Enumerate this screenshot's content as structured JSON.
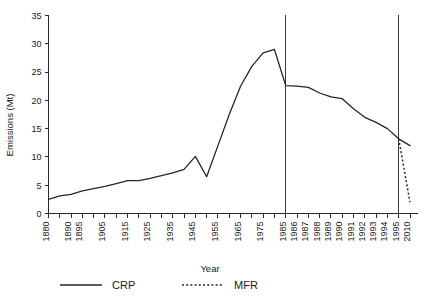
{
  "chart_data": {
    "type": "line",
    "title": "",
    "xlabel": "Year",
    "ylabel": "Emissions (Mt)",
    "ylim": [
      0,
      35
    ],
    "yticks": [
      0,
      5,
      10,
      15,
      20,
      25,
      30,
      35
    ],
    "ytick_labels": [
      "0",
      "5",
      "10",
      "15",
      "20",
      "25",
      "30",
      "35"
    ],
    "grid": false,
    "legend_position": "below-axes",
    "x_axis_note": "non-uniform category axis: 5-year steps 1880-1985, yearly 1985-1995, then 2010",
    "xticks": [
      "1880",
      "1885",
      "1890",
      "1895",
      "1900",
      "1905",
      "1910",
      "1915",
      "1920",
      "1925",
      "1930",
      "1935",
      "1940",
      "1945",
      "1950",
      "1955",
      "1960",
      "1965",
      "1970",
      "1975",
      "1980",
      "1985",
      "1986",
      "1987",
      "1988",
      "1989",
      "1990",
      "1991",
      "1992",
      "1993",
      "1994",
      "1995",
      "2010"
    ],
    "xtick_labels_shown": [
      "1880",
      "1890",
      "1895",
      "1905",
      "1915",
      "1925",
      "1935",
      "1945",
      "1955",
      "1965",
      "1975",
      "1985",
      "1986",
      "1987",
      "1988",
      "1989",
      "1990",
      "1991",
      "1992",
      "1993",
      "1994",
      "1995",
      "2010"
    ],
    "reference_lines": [
      {
        "at": "1985",
        "label": ""
      },
      {
        "at": "1995",
        "label": ""
      }
    ],
    "series": [
      {
        "name": "CRP",
        "style": "solid",
        "x": [
          "1880",
          "1885",
          "1890",
          "1895",
          "1900",
          "1905",
          "1910",
          "1915",
          "1920",
          "1925",
          "1930",
          "1935",
          "1940",
          "1945",
          "1950",
          "1955",
          "1960",
          "1965",
          "1970",
          "1975",
          "1980",
          "1985",
          "1986",
          "1987",
          "1988",
          "1989",
          "1990",
          "1991",
          "1992",
          "1993",
          "1994",
          "1995",
          "2010"
        ],
        "values": [
          2.5,
          3.1,
          3.4,
          4.0,
          4.4,
          4.8,
          5.3,
          5.8,
          5.8,
          6.2,
          6.7,
          7.2,
          7.8,
          10.1,
          6.5,
          12.0,
          17.5,
          22.5,
          26.0,
          28.4,
          29.0,
          22.6,
          22.5,
          22.3,
          21.3,
          20.6,
          20.3,
          18.5,
          17.0,
          16.1,
          15.0,
          13.2,
          12.0
        ]
      },
      {
        "name": "MFR",
        "style": "dotted",
        "x": [
          "1995",
          "2010"
        ],
        "values": [
          13.2,
          2.0
        ]
      }
    ]
  },
  "legend": {
    "items": [
      {
        "label": "CRP",
        "style": "solid"
      },
      {
        "label": "MFR",
        "style": "dotted"
      }
    ]
  }
}
